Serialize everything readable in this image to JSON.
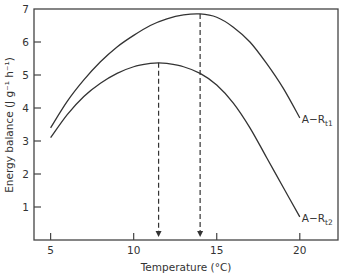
{
  "chart_data": {
    "type": "line",
    "title": "",
    "xlabel": "Temperature (°C)",
    "ylabel": "Energy balance (J g⁻¹ h⁻¹)",
    "xlim": [
      4.0,
      22.3
    ],
    "ylim": [
      0,
      7
    ],
    "xticks": [
      5,
      10,
      15,
      20
    ],
    "yticks": [
      1,
      2,
      3,
      4,
      5,
      6,
      7
    ],
    "grid": false,
    "series": [
      {
        "name": "A-R_t1",
        "label_main": "A−R",
        "label_sub": "t1",
        "x": [
          5,
          6,
          7,
          8,
          9,
          10,
          11,
          12,
          13,
          14,
          15,
          16,
          17,
          18,
          19,
          20
        ],
        "values": [
          3.4,
          4.2,
          4.85,
          5.4,
          5.85,
          6.2,
          6.5,
          6.7,
          6.82,
          6.85,
          6.75,
          6.45,
          6.0,
          5.35,
          4.6,
          3.7
        ]
      },
      {
        "name": "A-R_t2",
        "label_main": "A−R",
        "label_sub": "t2",
        "x": [
          5,
          6,
          7,
          8,
          9,
          10,
          11,
          11.5,
          12,
          13,
          14,
          15,
          16,
          17,
          18,
          19,
          20
        ],
        "values": [
          3.1,
          3.8,
          4.35,
          4.75,
          5.05,
          5.25,
          5.35,
          5.37,
          5.35,
          5.25,
          5.05,
          4.7,
          4.15,
          3.4,
          2.5,
          1.6,
          0.7
        ]
      }
    ],
    "annotations": [
      {
        "type": "dashed-arrow-down",
        "x": 14.0,
        "from_y": 6.85,
        "to_y": 0,
        "series": "A-R_t1",
        "meaning": "optimum temperature"
      },
      {
        "type": "dashed-arrow-down",
        "x": 11.5,
        "from_y": 5.37,
        "to_y": 0,
        "series": "A-R_t2",
        "meaning": "optimum temperature"
      }
    ]
  }
}
